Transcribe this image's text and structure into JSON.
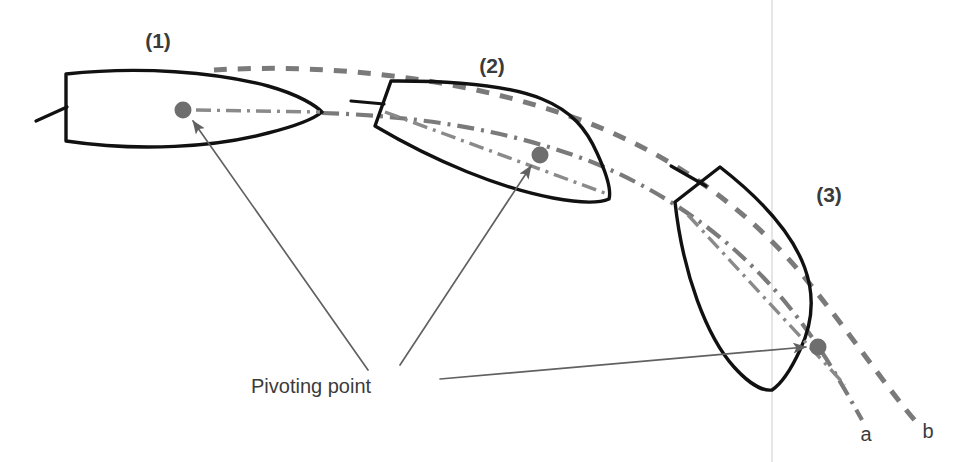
{
  "canvas": {
    "width": 964,
    "height": 462,
    "background": "#ffffff"
  },
  "colors": {
    "hull_stroke": "#111111",
    "track_stroke": "#7a7a7a",
    "pivot_dot": "#6e6e6e",
    "leader_line": "#616161",
    "guide_line": "#d8d8d8",
    "text": "#3b3b3b",
    "background": "#ffffff"
  },
  "labels": {
    "position_1": "(1)",
    "position_2": "(2)",
    "position_3": "(3)",
    "track_a": "a",
    "track_b": "b",
    "pivoting_point": "Pivoting point"
  },
  "ships": [
    {
      "id": "ship-1",
      "label": "(1)",
      "heading_deg": 0,
      "pivot_point": {
        "x": 183,
        "y": 110
      },
      "label_position": {
        "x": 158,
        "y": 48
      }
    },
    {
      "id": "ship-2",
      "label": "(2)",
      "heading_deg": 20,
      "pivot_point": {
        "x": 540,
        "y": 155
      },
      "label_position": {
        "x": 492,
        "y": 73
      }
    },
    {
      "id": "ship-3",
      "label": "(3)",
      "heading_deg": 62,
      "pivot_point": {
        "x": 818,
        "y": 347
      },
      "label_position": {
        "x": 829,
        "y": 202
      }
    }
  ],
  "tracks": [
    {
      "id": "track-a",
      "label": "a",
      "style": "dash-dot",
      "description": "path traced by the pivoting point",
      "label_position": {
        "x": 866,
        "y": 440
      }
    },
    {
      "id": "track-b",
      "label": "b",
      "style": "dashed",
      "description": "path traced by the ship side/outer hull",
      "label_position": {
        "x": 928,
        "y": 438
      }
    }
  ],
  "callout": {
    "text": "Pivoting point",
    "text_position": {
      "x": 251,
      "y": 393
    },
    "leaders": [
      {
        "from": {
          "x": 368,
          "y": 370
        },
        "to": {
          "x": 191,
          "y": 119
        }
      },
      {
        "from": {
          "x": 400,
          "y": 365
        },
        "to": {
          "x": 532,
          "y": 164
        }
      },
      {
        "from": {
          "x": 440,
          "y": 379
        },
        "to": {
          "x": 808,
          "y": 347
        }
      }
    ]
  },
  "guide": {
    "id": "vertical-guide",
    "x": 772,
    "y_top": 0,
    "y_bottom": 462
  }
}
